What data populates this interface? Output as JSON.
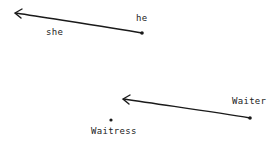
{
  "diagram": {
    "labels": {
      "he": "he",
      "she": "she",
      "waiter": "Waiter",
      "waitress": "Waitress"
    },
    "colors": {
      "ink": "#1a1a1a",
      "background": "#ffffff"
    },
    "arrows": [
      {
        "from": "he",
        "to": "she-direction",
        "start": [
          142,
          33
        ],
        "end": [
          16,
          13
        ]
      },
      {
        "from": "Waiter",
        "to": "Waitress-direction",
        "start": [
          250,
          118
        ],
        "end": [
          124,
          99
        ]
      }
    ],
    "points": [
      {
        "name": "he",
        "pos": [
          142,
          33
        ]
      },
      {
        "name": "Waiter",
        "pos": [
          250,
          118
        ]
      },
      {
        "name": "Waitress",
        "pos": [
          111,
          120
        ]
      }
    ]
  }
}
